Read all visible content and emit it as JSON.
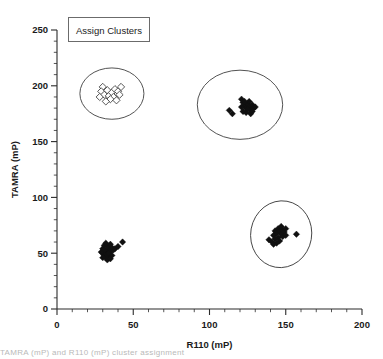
{
  "figure": {
    "legend_label": "Assign Clusters",
    "caption_partial": "TAMRA (mP) and R110 (mP) cluster assignment"
  },
  "chart_data": {
    "type": "scatter",
    "title": "",
    "xlabel": "R110 (mP)",
    "ylabel": "TAMRA (mP)",
    "xlim": [
      0,
      200
    ],
    "ylim": [
      0,
      250
    ],
    "xticks": [
      0,
      50,
      100,
      150,
      200
    ],
    "yticks": [
      0,
      50,
      100,
      150,
      200,
      250
    ],
    "xminor_step": 10,
    "yminor_step": 10,
    "grid": false,
    "legend_position": "top-left",
    "series": [
      {
        "name": "Cluster 1 (open diamonds)",
        "marker": "diamond-open",
        "color": "#ffffff",
        "edge_color": "#3a3a3a",
        "points": [
          [
            30,
            199
          ],
          [
            29,
            195
          ],
          [
            31,
            192
          ],
          [
            28,
            190
          ],
          [
            33,
            196
          ],
          [
            34,
            191
          ],
          [
            36,
            194
          ],
          [
            37,
            190
          ],
          [
            35,
            188
          ],
          [
            38,
            197
          ],
          [
            40,
            195
          ],
          [
            41,
            192
          ],
          [
            42,
            199
          ],
          [
            39,
            187
          ],
          [
            32,
            186
          ]
        ]
      },
      {
        "name": "Cluster 2 (lower left)",
        "marker": "diamond-filled",
        "color": "#101010",
        "points": [
          [
            30,
            50
          ],
          [
            31,
            48
          ],
          [
            32,
            52
          ],
          [
            30,
            54
          ],
          [
            33,
            49
          ],
          [
            32,
            46
          ],
          [
            34,
            53
          ],
          [
            33,
            56
          ],
          [
            31,
            57
          ],
          [
            35,
            51
          ],
          [
            34,
            47
          ],
          [
            36,
            55
          ],
          [
            35,
            58
          ],
          [
            29,
            51
          ],
          [
            30,
            46
          ],
          [
            32,
            59
          ],
          [
            37,
            53
          ],
          [
            38,
            54
          ],
          [
            40,
            56
          ],
          [
            43,
            60
          ],
          [
            33,
            44
          ],
          [
            31,
            53
          ],
          [
            34,
            50
          ],
          [
            36,
            48
          ],
          [
            35,
            45
          ]
        ]
      },
      {
        "name": "Cluster 3 (middle)",
        "marker": "diamond-filled",
        "color": "#101010",
        "points": [
          [
            113,
            178
          ],
          [
            115,
            175
          ],
          [
            121,
            188
          ],
          [
            122,
            185
          ],
          [
            123,
            182
          ],
          [
            124,
            180
          ],
          [
            125,
            184
          ],
          [
            126,
            181
          ],
          [
            127,
            178
          ],
          [
            124,
            176
          ],
          [
            122,
            177
          ],
          [
            126,
            186
          ],
          [
            128,
            183
          ],
          [
            129,
            180
          ],
          [
            127,
            175
          ],
          [
            125,
            179
          ],
          [
            123,
            186
          ],
          [
            121,
            181
          ],
          [
            128,
            177
          ],
          [
            130,
            181
          ]
        ]
      },
      {
        "name": "Cluster 4 (lower right)",
        "marker": "diamond-filled",
        "color": "#101010",
        "points": [
          [
            139,
            62
          ],
          [
            141,
            60
          ],
          [
            142,
            66
          ],
          [
            143,
            70
          ],
          [
            144,
            68
          ],
          [
            145,
            72
          ],
          [
            146,
            70
          ],
          [
            147,
            67
          ],
          [
            148,
            71
          ],
          [
            145,
            64
          ],
          [
            143,
            63
          ],
          [
            146,
            61
          ],
          [
            147,
            74
          ],
          [
            149,
            69
          ],
          [
            150,
            72
          ],
          [
            144,
            59
          ],
          [
            142,
            58
          ],
          [
            148,
            65
          ],
          [
            150,
            66
          ],
          [
            157,
            67
          ]
        ]
      }
    ],
    "cluster_rings": [
      {
        "name": "ring-cluster-1",
        "cx": 36,
        "cy": 193,
        "rx": 21,
        "ry": 23,
        "rotation": 0
      },
      {
        "name": "ring-cluster-3",
        "cx": 120,
        "cy": 183,
        "rx": 28,
        "ry": 31,
        "rotation": 0
      },
      {
        "name": "ring-cluster-4",
        "cx": 147,
        "cy": 67,
        "rx": 20,
        "ry": 30,
        "rotation": 10
      }
    ]
  }
}
